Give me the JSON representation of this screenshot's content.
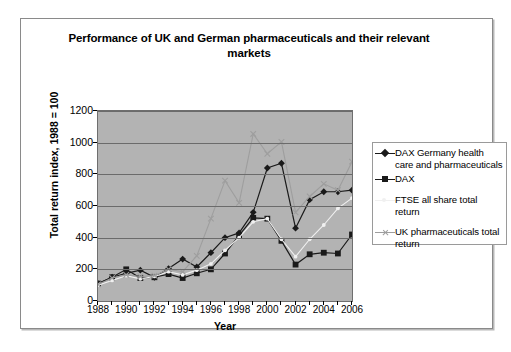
{
  "chart_data": {
    "type": "line",
    "title": "Performance of UK and German pharmaceuticals and their relevant markets",
    "xlabel": "Year",
    "ylabel": "Total return index, 1988 = 100",
    "xlim": [
      1988,
      2006
    ],
    "ylim": [
      0,
      1200
    ],
    "y_ticks": [
      0,
      200,
      400,
      600,
      800,
      1000,
      1200
    ],
    "x_ticks": [
      1988,
      1990,
      1992,
      1994,
      1996,
      1998,
      2000,
      2002,
      2004,
      2006
    ],
    "x_tick_all_years": [
      1988,
      1989,
      1990,
      1991,
      1992,
      1993,
      1994,
      1995,
      1996,
      1997,
      1998,
      1999,
      2000,
      2001,
      2002,
      2003,
      2004,
      2005,
      2006
    ],
    "grid": true,
    "legend_position": "right",
    "plot_background": "#b3b3b3",
    "x": [
      1988,
      1989,
      1990,
      1991,
      1992,
      1993,
      1994,
      1995,
      1996,
      1997,
      1998,
      1999,
      2000,
      2001,
      2002,
      2003,
      2004,
      2005,
      2006
    ],
    "series": [
      {
        "name": "DAX Germany health care and pharmaceuticals",
        "color": "#1a1a1a",
        "marker": "diamond",
        "values": [
          110,
          150,
          175,
          195,
          150,
          205,
          265,
          215,
          305,
          400,
          430,
          560,
          840,
          870,
          460,
          640,
          690,
          690,
          700
        ]
      },
      {
        "name": "DAX",
        "color": "#1a1a1a",
        "marker": "square",
        "values": [
          110,
          150,
          200,
          145,
          150,
          170,
          145,
          175,
          200,
          300,
          415,
          525,
          520,
          380,
          230,
          295,
          305,
          300,
          420
        ]
      },
      {
        "name": "FTSE all share total return",
        "color": "#f0f0f0",
        "marker": "dot",
        "values": [
          100,
          130,
          160,
          140,
          155,
          185,
          165,
          195,
          235,
          320,
          400,
          500,
          520,
          390,
          280,
          390,
          480,
          585,
          650
        ]
      },
      {
        "name": "UK pharmaceuticals total return",
        "color": "#9e9e9e",
        "marker": "x",
        "values": [
          105,
          145,
          165,
          155,
          160,
          200,
          185,
          285,
          520,
          760,
          620,
          1055,
          930,
          1005,
          560,
          660,
          740,
          700,
          880
        ]
      }
    ]
  },
  "legend": {
    "items": [
      {
        "label": "DAX Germany health care and pharmaceuticals",
        "marker": "diamond",
        "color": "#1a1a1a"
      },
      {
        "label": "DAX",
        "marker": "square",
        "color": "#1a1a1a"
      },
      {
        "label": "FTSE all share total return",
        "marker": "dot",
        "color": "#f0f0f0"
      },
      {
        "label": "UK pharmaceuticals total return",
        "marker": "x",
        "color": "#9e9e9e"
      }
    ]
  }
}
